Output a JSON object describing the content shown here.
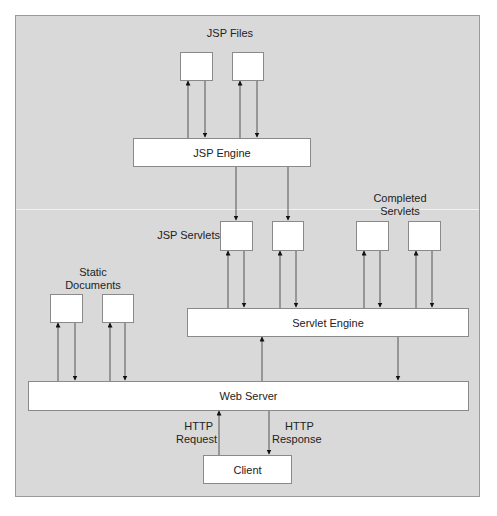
{
  "diagram": {
    "type": "architecture",
    "colors": {
      "background": "#d9d9d9",
      "box_fill": "#ffffff",
      "border": "#8a8a8a",
      "line": "#555555",
      "text": "#222222"
    },
    "labels": {
      "jsp_files": "JSP Files",
      "jsp_servlets": "JSP Servlets",
      "completed_servlets_line1": "Completed",
      "completed_servlets_line2": "Servlets",
      "static_documents_line1": "Static",
      "static_documents_line2": "Documents",
      "http_request_line1": "HTTP",
      "http_request_line2": "Request",
      "http_response_line1": "HTTP",
      "http_response_line2": "Response"
    },
    "nodes": {
      "jsp_engine": "JSP Engine",
      "servlet_engine": "Servlet Engine",
      "web_server": "Web Server",
      "client": "Client"
    },
    "edges": [
      {
        "from": "JSP Engine",
        "to": "JSP File 1"
      },
      {
        "from": "JSP File 1",
        "to": "JSP Engine"
      },
      {
        "from": "JSP Engine",
        "to": "JSP File 2"
      },
      {
        "from": "JSP File 2",
        "to": "JSP Engine"
      },
      {
        "from": "JSP Engine",
        "to": "JSP Servlet 1"
      },
      {
        "from": "JSP Engine",
        "to": "JSP Servlet 2"
      },
      {
        "from": "Servlet Engine",
        "to": "JSP Servlet 1"
      },
      {
        "from": "JSP Servlet 1",
        "to": "Servlet Engine"
      },
      {
        "from": "Servlet Engine",
        "to": "JSP Servlet 2"
      },
      {
        "from": "JSP Servlet 2",
        "to": "Servlet Engine"
      },
      {
        "from": "Servlet Engine",
        "to": "Completed Servlet 1"
      },
      {
        "from": "Completed Servlet 1",
        "to": "Servlet Engine"
      },
      {
        "from": "Servlet Engine",
        "to": "Completed Servlet 2"
      },
      {
        "from": "Completed Servlet 2",
        "to": "Servlet Engine"
      },
      {
        "from": "Web Server",
        "to": "Static Document 1"
      },
      {
        "from": "Static Document 1",
        "to": "Web Server"
      },
      {
        "from": "Web Server",
        "to": "Static Document 2"
      },
      {
        "from": "Static Document 2",
        "to": "Web Server"
      },
      {
        "from": "Web Server",
        "to": "Servlet Engine"
      },
      {
        "from": "Servlet Engine",
        "to": "Web Server"
      },
      {
        "from": "Client",
        "to": "Web Server",
        "label": "HTTP Request"
      },
      {
        "from": "Web Server",
        "to": "Client",
        "label": "HTTP Response"
      }
    ]
  }
}
